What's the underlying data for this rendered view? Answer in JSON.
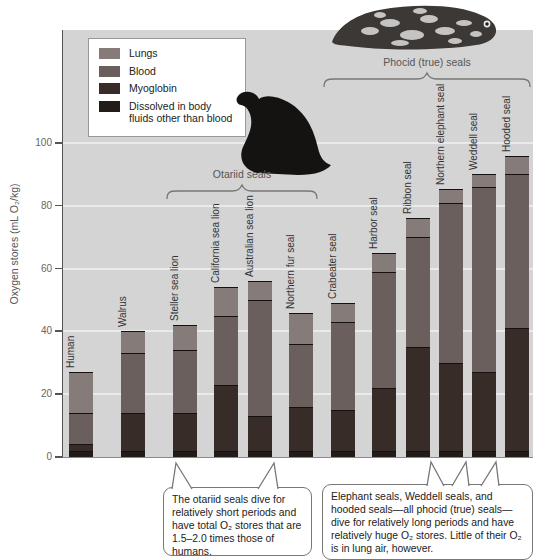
{
  "figure": {
    "plot_background": "#d4d4d4",
    "gridline_color": "#eaeaea",
    "y_axis": {
      "label": "Oxygen stores (mL O₂/kg)",
      "ticks": [
        0,
        20,
        40,
        60,
        80,
        100
      ]
    },
    "legend": {
      "items": [
        {
          "label": "Lungs",
          "color": "#857b78"
        },
        {
          "label": "Blood",
          "color": "#6a5f5c"
        },
        {
          "label": "Myoglobin",
          "color": "#382c29"
        },
        {
          "label": "Dissolved in body fluids other than blood",
          "color": "#211b19"
        }
      ]
    },
    "groups": [
      {
        "label": "Otariid seals"
      },
      {
        "label": "Phocid (true) seals"
      }
    ],
    "annotations": {
      "otariid": "The otariid seals dive for relatively short periods and have total O₂ stores that are 1.5–2.0 times those of humans.",
      "phocid": "Elephant seals, Weddell seals, and hooded seals—all phocid (true) seals—dive for relatively long periods and have relatively huge O₂ stores. Little of their O₂ is in lung air, however."
    },
    "illustrations": {
      "sea_lion": "otariid sea lion silhouette",
      "phocid_seal": "spotted phocid seal"
    }
  },
  "chart_data": {
    "type": "bar",
    "stacked": true,
    "title": "",
    "xlabel": "",
    "ylabel": "Oxygen stores (mL O₂/kg)",
    "ylim": [
      0,
      110
    ],
    "grid": true,
    "legend_position": "upper-left",
    "categories": [
      "Human",
      "Walrus",
      "Steller sea lion",
      "California sea lion",
      "Australian sea lion",
      "Northern fur seal",
      "Crabeater seal",
      "Harbor seal",
      "Ribbon seal",
      "Northern elephant seal",
      "Weddell seal",
      "Hooded seal"
    ],
    "series": [
      {
        "name": "Dissolved in body fluids other than blood",
        "color": "#211b19",
        "values": [
          2,
          2,
          2,
          2,
          2,
          2,
          2,
          2,
          2,
          2,
          2,
          2
        ]
      },
      {
        "name": "Myoglobin",
        "color": "#382c29",
        "values": [
          2,
          12,
          12,
          21,
          11,
          14,
          13,
          20,
          33,
          28,
          25,
          39
        ]
      },
      {
        "name": "Blood",
        "color": "#6a5f5c",
        "values": [
          10,
          19,
          20,
          22,
          37,
          20,
          28,
          37,
          35,
          51,
          59,
          49
        ]
      },
      {
        "name": "Lungs",
        "color": "#857b78",
        "values": [
          13,
          7,
          8,
          9,
          6,
          10,
          6,
          6,
          6,
          4.5,
          4,
          6
        ]
      }
    ],
    "totals": [
      27,
      40,
      42,
      54,
      56,
      46,
      49,
      65,
      76,
      85.5,
      90,
      96
    ],
    "group_membership": {
      "otariid_seals": [
        2,
        3,
        4,
        5
      ],
      "phocid_true_seals": [
        6,
        7,
        8,
        9,
        10,
        11
      ]
    }
  }
}
